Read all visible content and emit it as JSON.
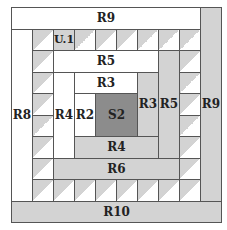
{
  "diagram": {
    "title": "",
    "grid": {
      "cols": 10,
      "rows": 10,
      "unit_w": 21,
      "unit_h": 21.5
    },
    "colors": {
      "white": "#ffffff",
      "light_gray": "#d3d3d3",
      "dark_gray": "#8c8c8c",
      "border": "#555555"
    },
    "blocks": [
      {
        "id": "R9_top",
        "label": "R9",
        "col": 0,
        "row": 0,
        "w": 9,
        "h": 1,
        "fill": "white"
      },
      {
        "id": "R9_right",
        "label": "R9",
        "col": 9,
        "row": 0,
        "w": 1,
        "h": 9,
        "fill": "gray"
      },
      {
        "id": "R10",
        "label": "R10",
        "col": 0,
        "row": 9,
        "w": 10,
        "h": 1,
        "fill": "gray"
      },
      {
        "id": "R8",
        "label": "R8",
        "col": 0,
        "row": 1,
        "w": 1,
        "h": 8,
        "fill": "white"
      },
      {
        "id": "R5_top",
        "label": "R5",
        "col": 2,
        "row": 2,
        "w": 5,
        "h": 1,
        "fill": "white"
      },
      {
        "id": "R5_right",
        "label": "R5",
        "col": 7,
        "row": 2,
        "w": 1,
        "h": 5,
        "fill": "gray"
      },
      {
        "id": "R4_left",
        "label": "R4",
        "col": 2,
        "row": 3,
        "w": 1,
        "h": 4,
        "fill": "white"
      },
      {
        "id": "R4_bottom",
        "label": "R4",
        "col": 3,
        "row": 6,
        "w": 4,
        "h": 1,
        "fill": "gray"
      },
      {
        "id": "R3_top",
        "label": "R3",
        "col": 3,
        "row": 3,
        "w": 3,
        "h": 1,
        "fill": "white"
      },
      {
        "id": "R3_right",
        "label": "R3",
        "col": 6,
        "row": 3,
        "w": 1,
        "h": 3,
        "fill": "gray"
      },
      {
        "id": "R2",
        "label": "R2",
        "col": 3,
        "row": 4,
        "w": 1,
        "h": 2,
        "fill": "white"
      },
      {
        "id": "S2",
        "label": "S2",
        "col": 4,
        "row": 4,
        "w": 2,
        "h": 2,
        "fill": "dark"
      },
      {
        "id": "R6",
        "label": "R6",
        "col": 2,
        "row": 7,
        "w": 6,
        "h": 1,
        "fill": "gray"
      }
    ],
    "triangle_label": "U.1",
    "triangles": [
      {
        "col": 1,
        "row": 1
      },
      {
        "col": 2,
        "row": 1,
        "label": "U.1"
      },
      {
        "col": 3,
        "row": 1
      },
      {
        "col": 4,
        "row": 1
      },
      {
        "col": 5,
        "row": 1
      },
      {
        "col": 6,
        "row": 1
      },
      {
        "col": 7,
        "row": 1
      },
      {
        "col": 8,
        "row": 1
      },
      {
        "col": 1,
        "row": 2
      },
      {
        "col": 1,
        "row": 3
      },
      {
        "col": 1,
        "row": 4
      },
      {
        "col": 1,
        "row": 5
      },
      {
        "col": 1,
        "row": 6
      },
      {
        "col": 1,
        "row": 7
      },
      {
        "col": 1,
        "row": 8
      },
      {
        "col": 2,
        "row": 8
      },
      {
        "col": 3,
        "row": 8
      },
      {
        "col": 4,
        "row": 8
      },
      {
        "col": 5,
        "row": 8
      },
      {
        "col": 6,
        "row": 8
      },
      {
        "col": 7,
        "row": 8
      },
      {
        "col": 8,
        "row": 8
      },
      {
        "col": 8,
        "row": 2
      },
      {
        "col": 8,
        "row": 3
      },
      {
        "col": 8,
        "row": 4
      },
      {
        "col": 8,
        "row": 5
      },
      {
        "col": 8,
        "row": 6
      },
      {
        "col": 8,
        "row": 7
      }
    ]
  }
}
